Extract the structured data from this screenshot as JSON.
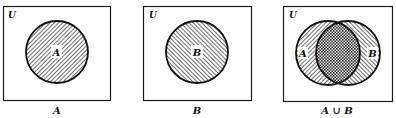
{
  "diagram": {
    "type": "venn",
    "panels": [
      {
        "id": "panel-a",
        "universe_label": "U",
        "sets": [
          {
            "label": "A",
            "shaded": true
          }
        ],
        "caption": "A"
      },
      {
        "id": "panel-b",
        "universe_label": "U",
        "sets": [
          {
            "label": "B",
            "shaded": true
          }
        ],
        "caption": "B"
      },
      {
        "id": "panel-union",
        "universe_label": "U",
        "sets": [
          {
            "label": "A",
            "shaded": true
          },
          {
            "label": "B",
            "shaded": true
          }
        ],
        "overlap_shading": "crosshatch",
        "caption": "A ∪ B"
      }
    ],
    "colors": {
      "ink": "#111111",
      "background": "#ffffff"
    }
  }
}
